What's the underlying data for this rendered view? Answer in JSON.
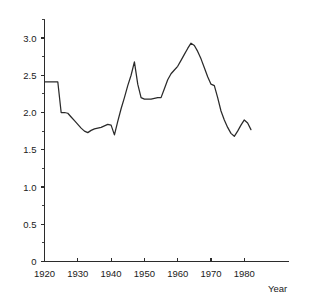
{
  "chart_data": {
    "type": "line",
    "title": "",
    "subtitle": "",
    "xlabel": "Year",
    "ylabel": "",
    "xlim": [
      1918,
      1990
    ],
    "ylim": [
      0,
      3.35
    ],
    "grid": false,
    "legend": null,
    "x_ticks": [
      1920,
      1930,
      1940,
      1950,
      1960,
      1970,
      1980
    ],
    "x_tick_labels": [
      "1920",
      "1930",
      "1940",
      "1950",
      "1960",
      "1970",
      "1980"
    ],
    "y_ticks": [
      0,
      0.5,
      1.0,
      1.5,
      2.0,
      2.5,
      3.0
    ],
    "y_tick_labels": [
      "0",
      "0.5",
      "1.0",
      "1.5",
      "2.0",
      "2.5",
      "3.0"
    ],
    "y_minor_ticks": [
      0.25,
      0.75,
      1.25,
      1.75,
      2.25,
      2.75,
      3.25
    ],
    "line_color": "#2a2a2a",
    "series": [
      {
        "name": "series-1",
        "x": [
          1920,
          1921,
          1922,
          1923,
          1924,
          1925,
          1926,
          1927,
          1928,
          1929,
          1930,
          1931,
          1932,
          1933,
          1934,
          1935,
          1936,
          1937,
          1938,
          1939,
          1940,
          1941,
          1942,
          1943,
          1944,
          1945,
          1946,
          1947,
          1948,
          1949,
          1950,
          1951,
          1952,
          1953,
          1954,
          1955,
          1956,
          1957,
          1958,
          1959,
          1960,
          1961,
          1962,
          1963,
          1964,
          1965,
          1966,
          1967,
          1968,
          1969,
          1970,
          1971,
          1972,
          1973,
          1974,
          1975,
          1976,
          1977,
          1978,
          1979,
          1980,
          1981,
          1982
        ],
        "values": [
          2.41,
          2.41,
          2.41,
          2.41,
          2.41,
          2.0,
          2.0,
          1.99,
          1.94,
          1.89,
          1.84,
          1.79,
          1.75,
          1.73,
          1.76,
          1.78,
          1.79,
          1.8,
          1.82,
          1.84,
          1.83,
          1.7,
          1.88,
          2.05,
          2.2,
          2.36,
          2.5,
          2.68,
          2.38,
          2.2,
          2.18,
          2.18,
          2.18,
          2.19,
          2.2,
          2.2,
          2.32,
          2.44,
          2.52,
          2.57,
          2.62,
          2.7,
          2.78,
          2.86,
          2.93,
          2.9,
          2.82,
          2.72,
          2.6,
          2.48,
          2.38,
          2.36,
          2.2,
          2.02,
          1.9,
          1.8,
          1.72,
          1.68,
          1.75,
          1.83,
          1.9,
          1.86,
          1.77
        ]
      }
    ]
  },
  "axis": {
    "year_label": "Year"
  }
}
